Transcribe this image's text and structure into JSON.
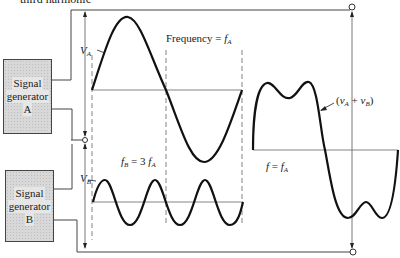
{
  "caption_top": "third harmonic",
  "generators": [
    {
      "line1": "Signal",
      "line2": "generator",
      "id": "A"
    },
    {
      "line1": "Signal",
      "line2": "generator",
      "id": "B"
    }
  ],
  "labels": {
    "va_symbol": "V",
    "va_sub": "A",
    "vb_symbol": "V",
    "vb_sub": "B",
    "frequency_text": "Frequency = ",
    "frequency_f": "f",
    "frequency_sub": "A",
    "fb_f": "f",
    "fb_sub": "B",
    "fb_eq": " = 3 ",
    "fb_fa": "f",
    "fb_fa_sub": "A",
    "f_eq_lhs": "f",
    "f_eq_mid": " = ",
    "f_eq_rhs": "f",
    "f_eq_sub": "A",
    "sum_open": "(",
    "sum_va": "v",
    "sum_va_sub": "A",
    "sum_plus": " + ",
    "sum_vb": "v",
    "sum_vb_sub": "B",
    "sum_close": ")"
  },
  "colors": {
    "stroke": "#111111",
    "thin": "#555555",
    "box_fill": "#d8d8d8"
  }
}
